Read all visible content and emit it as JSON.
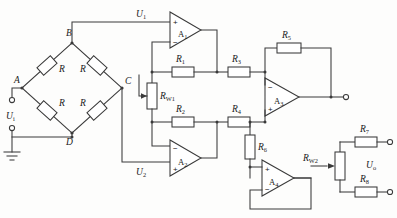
{
  "diagram": {
    "line_color": "#3a3a3a",
    "background": "#fdfdfc"
  },
  "nodes": {
    "a": "A",
    "b": "B",
    "c": "C",
    "d": "D"
  },
  "signals": {
    "input": "U",
    "input_sub": "i",
    "u1": "U",
    "u1_sub": "1",
    "u2": "U",
    "u2_sub": "2",
    "output": "U",
    "output_sub": "o"
  },
  "bridge": {
    "r_top_left": "R",
    "r_top_right": "R",
    "r_bottom_left": "R",
    "r_bottom_right": "R"
  },
  "resistors": {
    "r1": "R",
    "r1_sub": "1",
    "r2": "R",
    "r2_sub": "2",
    "r3": "R",
    "r3_sub": "3",
    "r4": "R",
    "r4_sub": "4",
    "r5": "R",
    "r5_sub": "5",
    "r6": "R",
    "r6_sub": "6",
    "r7": "R",
    "r7_sub": "7",
    "r8": "R",
    "r8_sub": "8"
  },
  "potentiometers": {
    "rw1": "R",
    "rw1_sub": "W1",
    "rw2": "R",
    "rw2_sub": "W2"
  },
  "opamps": {
    "a1": {
      "name": "A",
      "sub": "1",
      "plus": "+",
      "minus": "−",
      "plus_pos": "top"
    },
    "a2": {
      "name": "A",
      "sub": "2",
      "plus": "+",
      "minus": "−",
      "plus_pos": "bottom"
    },
    "a3": {
      "name": "A",
      "sub": "3",
      "plus": "+",
      "minus": "−",
      "plus_pos": "bottom"
    },
    "a4": {
      "name": "A",
      "sub": "4",
      "plus": "+",
      "minus": "−",
      "plus_pos": "top"
    }
  }
}
